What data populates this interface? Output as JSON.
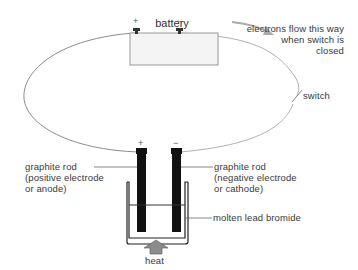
{
  "diagram": {
    "battery": {
      "label": "battery",
      "positive_sign": "+",
      "negative_sign": "−"
    },
    "electron_flow": {
      "line1": "electrons flow this way",
      "line2": "when switch is",
      "line3": "closed"
    },
    "switch": {
      "label": "switch"
    },
    "anode": {
      "sign": "+",
      "line1": "graphite rod",
      "line2": "(positive electrode",
      "line3": "or anode)"
    },
    "cathode": {
      "sign": "−",
      "line1": "graphite rod",
      "line2": "(negative electrode",
      "line3": "or cathode)"
    },
    "electrolyte": {
      "label": "molten lead bromide"
    },
    "heat": {
      "label": "heat"
    },
    "colors": {
      "wire": "#8a8a8a",
      "rod": "#111111",
      "battery_fill": "#f4f4f4",
      "arrow": "#9a9a9a",
      "heat_arrow": "#8c8c8c"
    }
  }
}
